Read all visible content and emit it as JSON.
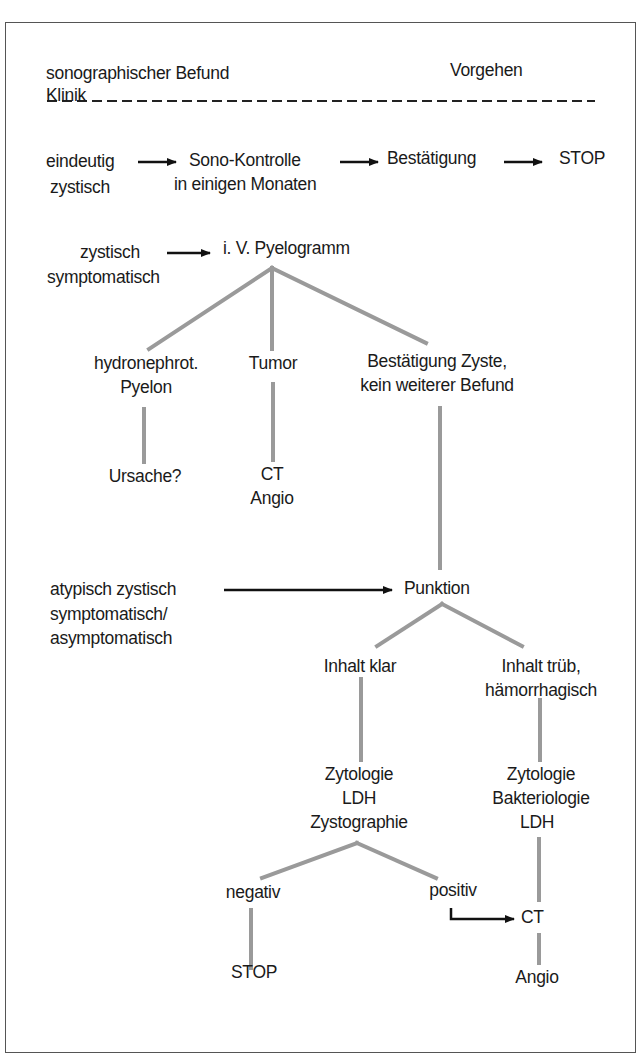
{
  "header": {
    "left_line1": "sonographischer Befund",
    "left_line2": "Klinik",
    "right": "Vorgehen"
  },
  "colors": {
    "text": "#1a1a1a",
    "connector": "#9a9a9a",
    "arrow": "#111111",
    "frame": "#555555",
    "background": "#ffffff"
  },
  "row1": {
    "condition_line1": "eindeutig",
    "condition_line2": "zystisch",
    "step1_line1": "Sono-Kontrolle",
    "step1_line2": "in einigen Monaten",
    "step2": "Bestätigung",
    "step3": "STOP"
  },
  "row2": {
    "condition_line1": "zystisch",
    "condition_line2": "symptomatisch",
    "node": "i. V. Pyelogramm",
    "branches": [
      {
        "line1": "hydronephrot.",
        "line2": "Pyelon",
        "next": "Ursache?"
      },
      {
        "line1": "Tumor",
        "next_line1": "CT",
        "next_line2": "Angio"
      },
      {
        "line1": "Bestätigung Zyste,",
        "line2": "kein weiterer Befund"
      }
    ]
  },
  "row3": {
    "condition_line1": "atypisch zystisch",
    "condition_line2": "symptomatisch/",
    "condition_line3": "asymptomatisch",
    "node": "Punktion",
    "left": {
      "label": "Inhalt klar",
      "tests_line1": "Zytologie",
      "tests_line2": "LDH",
      "tests_line3": "Zystographie",
      "negative": "negativ",
      "negative_next": "STOP",
      "positive": "positiv"
    },
    "right": {
      "label_line1": "Inhalt trüb,",
      "label_line2": "hämorrhagisch",
      "tests_line1": "Zytologie",
      "tests_line2": "Bakteriologie",
      "tests_line3": "LDH",
      "ct": "CT",
      "angio": "Angio"
    }
  }
}
